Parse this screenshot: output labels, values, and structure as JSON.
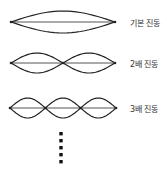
{
  "diagram": {
    "title": "",
    "stroke_color": "#222222",
    "modes": [
      {
        "label": "기본 진동",
        "harmonic": 1,
        "x_start": 11,
        "x_end": 115,
        "center_y": 22,
        "amplitude": 11
      },
      {
        "label": "2배 진동",
        "harmonic": 2,
        "x_start": 11,
        "x_end": 115,
        "center_y": 63,
        "amplitude": 10
      },
      {
        "label": "3배 진동",
        "harmonic": 3,
        "x_start": 10,
        "x_end": 116,
        "center_y": 108,
        "amplitude": 10
      }
    ],
    "continuation": {
      "dot_count": 5,
      "x": 61,
      "y_start": 132,
      "spacing": 7
    }
  }
}
